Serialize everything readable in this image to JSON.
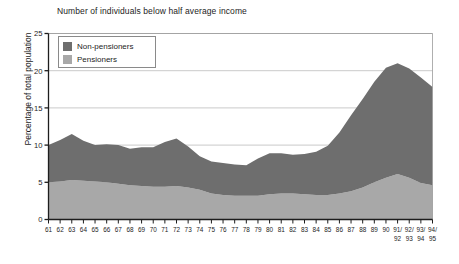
{
  "chart_data": {
    "type": "area",
    "title": "Number of individuals below half average income",
    "xlabel": "",
    "ylabel": "Percentage of total population",
    "stacked": true,
    "grid": true,
    "legend_position": "top-left",
    "ylim": [
      0,
      25
    ],
    "yticks": [
      0,
      5,
      10,
      15,
      20,
      25
    ],
    "categories": [
      "61",
      "62",
      "63",
      "64",
      "65",
      "66",
      "67",
      "68",
      "69",
      "70",
      "71",
      "72",
      "73",
      "74",
      "75",
      "76",
      "77",
      "78",
      "79",
      "80",
      "81",
      "82",
      "83",
      "84",
      "85",
      "86",
      "87",
      "88",
      "89",
      "90",
      "91/92",
      "92/93",
      "93/94",
      "94/95"
    ],
    "category_lines": [
      [
        "61"
      ],
      [
        "62"
      ],
      [
        "63"
      ],
      [
        "64"
      ],
      [
        "65"
      ],
      [
        "66"
      ],
      [
        "67"
      ],
      [
        "68"
      ],
      [
        "69"
      ],
      [
        "70"
      ],
      [
        "71"
      ],
      [
        "72"
      ],
      [
        "73"
      ],
      [
        "74"
      ],
      [
        "75"
      ],
      [
        "76"
      ],
      [
        "77"
      ],
      [
        "78"
      ],
      [
        "79"
      ],
      [
        "80"
      ],
      [
        "81"
      ],
      [
        "82"
      ],
      [
        "83"
      ],
      [
        "84"
      ],
      [
        "85"
      ],
      [
        "86"
      ],
      [
        "87"
      ],
      [
        "88"
      ],
      [
        "89"
      ],
      [
        "90"
      ],
      [
        "91/",
        "92"
      ],
      [
        "92/",
        "93"
      ],
      [
        "93/",
        "94"
      ],
      [
        "94/",
        "95"
      ]
    ],
    "series": [
      {
        "name": "Pensioners",
        "color": "#a8a8a8",
        "values": [
          5.0,
          5.1,
          5.3,
          5.2,
          5.1,
          5.0,
          4.8,
          4.6,
          4.5,
          4.4,
          4.4,
          4.5,
          4.3,
          4.0,
          3.5,
          3.3,
          3.2,
          3.2,
          3.2,
          3.4,
          3.5,
          3.5,
          3.4,
          3.3,
          3.3,
          3.5,
          3.8,
          4.3,
          5.0,
          5.6,
          6.1,
          5.6,
          4.9,
          4.6
        ]
      },
      {
        "name": "Non-pensioners",
        "color": "#6e6e6e",
        "values": [
          5.0,
          5.6,
          6.2,
          5.4,
          4.9,
          5.1,
          5.2,
          4.9,
          5.2,
          5.3,
          6.0,
          6.4,
          5.5,
          4.5,
          4.3,
          4.3,
          4.2,
          4.1,
          5.0,
          5.5,
          5.4,
          5.2,
          5.4,
          5.8,
          6.6,
          8.2,
          10.2,
          11.9,
          13.5,
          14.8,
          14.9,
          14.7,
          14.2,
          13.2
        ]
      }
    ],
    "totals": [
      10.0,
      10.7,
      11.5,
      10.6,
      10.0,
      10.1,
      10.0,
      9.5,
      9.7,
      9.7,
      10.4,
      10.9,
      9.8,
      8.5,
      7.8,
      7.6,
      7.4,
      7.3,
      8.2,
      8.9,
      8.9,
      8.7,
      8.8,
      9.1,
      9.9,
      11.7,
      14.0,
      16.2,
      18.5,
      20.4,
      21.0,
      20.3,
      19.1,
      17.8
    ],
    "annotations": []
  },
  "legend": {
    "items": [
      {
        "label": "Non-pensioners",
        "color": "#6e6e6e"
      },
      {
        "label": "Pensioners",
        "color": "#a8a8a8"
      }
    ]
  },
  "colors": {
    "axis": "#1d1d1d",
    "grid": "#bdbdbd",
    "plot_border": "#9a9a9a",
    "background": "#ffffff"
  }
}
